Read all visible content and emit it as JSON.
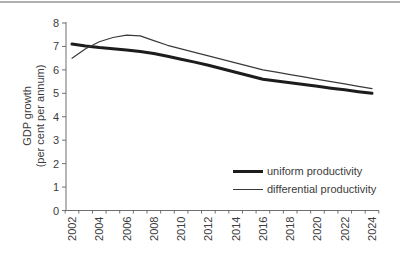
{
  "chart_data": {
    "type": "line",
    "title": "",
    "xlabel": "",
    "ylabel_line1": "GDP growth",
    "ylabel_line2": "(per cent per annum)",
    "ylim": [
      0,
      8
    ],
    "y_ticks": [
      0,
      1,
      2,
      3,
      4,
      5,
      6,
      7,
      8
    ],
    "grid": false,
    "legend_position": "inside-bottom-right",
    "x": [
      2002,
      2003,
      2004,
      2005,
      2006,
      2007,
      2008,
      2009,
      2010,
      2011,
      2012,
      2013,
      2014,
      2015,
      2016,
      2017,
      2018,
      2019,
      2020,
      2021,
      2022,
      2023,
      2024
    ],
    "x_tick_labels": [
      "2002",
      "2004",
      "2006",
      "2008",
      "2010",
      "2012",
      "2014",
      "2016",
      "2018",
      "2020",
      "2022",
      "2024"
    ],
    "series": [
      {
        "name": "uniform productivity",
        "style": "thick",
        "color": "#1c1c1c",
        "values": [
          7.1,
          7.02,
          6.95,
          6.9,
          6.85,
          6.78,
          6.7,
          6.58,
          6.45,
          6.33,
          6.2,
          6.05,
          5.9,
          5.75,
          5.6,
          5.52,
          5.45,
          5.38,
          5.3,
          5.22,
          5.15,
          5.07,
          5.0
        ]
      },
      {
        "name": "differential productivity",
        "style": "thin",
        "color": "#3a3a3a",
        "values": [
          6.5,
          6.9,
          7.2,
          7.38,
          7.48,
          7.45,
          7.25,
          7.05,
          6.9,
          6.75,
          6.6,
          6.45,
          6.3,
          6.15,
          6.0,
          5.9,
          5.8,
          5.7,
          5.6,
          5.5,
          5.4,
          5.3,
          5.2
        ]
      }
    ],
    "axis_color": "#6f6f6f",
    "top_rule_color": "#b0b0b0"
  }
}
